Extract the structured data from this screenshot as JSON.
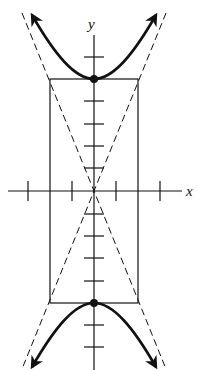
{
  "figure": {
    "type": "hyperbola",
    "x_axis_label": "x",
    "y_axis_label": "y",
    "vertices": [
      [
        0,
        5
      ],
      [
        0,
        -5
      ]
    ],
    "rectangle": {
      "x_min": -2,
      "x_max": 2,
      "y_min": -5,
      "y_max": 5
    },
    "asymptotes": [
      "y = 2.5x",
      "y = -2.5x"
    ],
    "x_ticks": [
      -3,
      -2,
      -1,
      1,
      2,
      3
    ],
    "y_ticks": [
      -7,
      -6,
      -4,
      -3,
      -2,
      -1,
      1,
      2,
      3,
      4,
      6,
      7
    ],
    "colors": {
      "stroke": "#111111",
      "background": "#ffffff"
    }
  }
}
